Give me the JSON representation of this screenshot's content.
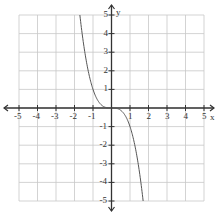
{
  "chart_data": {
    "type": "line",
    "title": "",
    "xlabel": "x",
    "ylabel": "y",
    "xlim": [
      -5,
      5
    ],
    "ylim": [
      -5,
      5
    ],
    "grid": true,
    "x_ticks": [
      -5,
      -4,
      -3,
      -2,
      -1,
      1,
      2,
      3,
      4,
      5
    ],
    "y_ticks": [
      5,
      4,
      3,
      2,
      1,
      -1,
      -2,
      -3,
      -4,
      -5
    ],
    "series": [
      {
        "name": "y = -x^3",
        "x": [
          -1.71,
          -1.5,
          -1.25,
          -1,
          -0.75,
          -0.5,
          -0.25,
          0,
          0.25,
          0.5,
          0.75,
          1,
          1.25,
          1.5,
          1.71
        ],
        "values": [
          5,
          3.375,
          1.953,
          1,
          0.422,
          0.125,
          0.016,
          0,
          -0.016,
          -0.125,
          -0.422,
          -1,
          -1.953,
          -3.375,
          -5
        ]
      }
    ],
    "colors": {
      "grid": "#c8c8c8",
      "axis": "#333333",
      "curve": "#555555"
    }
  },
  "axes": {
    "x_label": "x",
    "y_label": "y"
  }
}
